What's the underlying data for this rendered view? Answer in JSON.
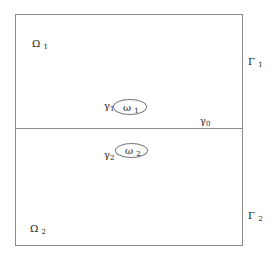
{
  "diagram": {
    "type": "domain-decomposition",
    "border_color": "#8a8a8a",
    "regions": [
      {
        "id": "Omega1",
        "symbol": "Ω",
        "sub": "1"
      },
      {
        "id": "Omega2",
        "symbol": "Ω",
        "sub": "2"
      }
    ],
    "boundaries": [
      {
        "id": "Gamma1",
        "symbol": "Γ",
        "sub": "1"
      },
      {
        "id": "Gamma2",
        "symbol": "Γ",
        "sub": "2"
      },
      {
        "id": "gamma0",
        "symbol": "γ",
        "sub": "0"
      }
    ],
    "subdomains": [
      {
        "id": "omega1",
        "symbol": "ω",
        "sub": "1",
        "boundary_symbol": "γ",
        "boundary_sub": "1"
      },
      {
        "id": "omega2",
        "symbol": "ω",
        "sub": "2",
        "boundary_symbol": "γ",
        "boundary_sub": "2"
      }
    ]
  }
}
